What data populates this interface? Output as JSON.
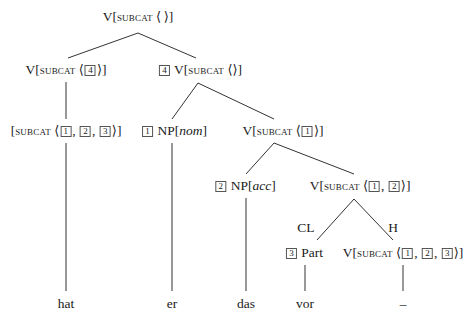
{
  "diagram": {
    "type": "syntax-tree",
    "nodes": {
      "root": {
        "cat": "V",
        "feature": "subcat",
        "list_open": "⟨",
        "list_close": "⟩",
        "items": []
      },
      "left": {
        "cat": "V",
        "feature": "subcat",
        "list_open": "⟨",
        "list_close": "⟩",
        "items": [
          "4"
        ]
      },
      "right": {
        "tag": "4",
        "cat": "V",
        "feature": "subcat",
        "list_open": "⟨",
        "list_close": "⟩",
        "items": []
      },
      "left_child": {
        "cat": "",
        "feature": "subcat",
        "list_open": "⟨",
        "list_close": "⟩",
        "items": [
          "1",
          "2",
          "3"
        ]
      },
      "np_nom": {
        "tag": "1",
        "cat": "NP",
        "case": "nom"
      },
      "v1": {
        "cat": "V",
        "feature": "subcat",
        "list_open": "⟨",
        "list_close": "⟩",
        "items": [
          "1"
        ]
      },
      "np_acc": {
        "tag": "2",
        "cat": "NP",
        "case": "acc"
      },
      "v12": {
        "cat": "V",
        "feature": "subcat",
        "list_open": "⟨",
        "list_close": "⟩",
        "items": [
          "1",
          "2"
        ]
      },
      "part": {
        "tag": "3",
        "cat": "Part"
      },
      "v123": {
        "cat": "V",
        "feature": "subcat",
        "list_open": "⟨",
        "list_close": "⟩",
        "items": [
          "1",
          "2",
          "3"
        ]
      }
    },
    "edge_labels": {
      "cl": "CL",
      "h": "H"
    },
    "words": {
      "hat": "hat",
      "er": "er",
      "das": "das",
      "vor": "vor",
      "trace": "_"
    },
    "punct": {
      "lbr": "[",
      "rbr": "]",
      "comma": ","
    }
  }
}
